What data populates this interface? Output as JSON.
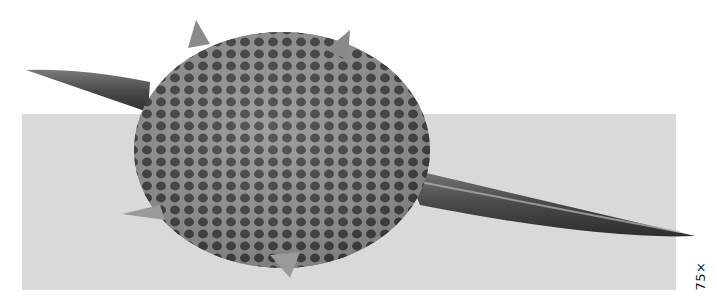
{
  "image": {
    "subject": "radiolarian-micrograph",
    "background_color": "#ffffff",
    "panel_color": "#d8d8d8",
    "body_color": "#5a5a5a",
    "pore_color": "#2e2e2e",
    "rim_color": "#a8a8a8"
  },
  "magnification_label": "75×"
}
